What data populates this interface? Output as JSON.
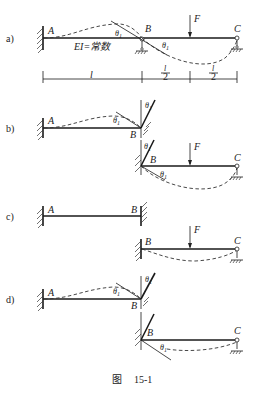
{
  "figure": {
    "caption_prefix": "图",
    "caption_number": "15-1"
  },
  "labels": {
    "A": "A",
    "B": "B",
    "C": "C",
    "F": "F",
    "theta": "θ",
    "theta_sub": "1",
    "stiffness": "EI=常数",
    "len_l": "l",
    "half_num": "l",
    "half_den": "2"
  },
  "panels": [
    {
      "id": "a",
      "label": "a)"
    },
    {
      "id": "b",
      "label": "b)"
    },
    {
      "id": "c",
      "label": "c)"
    },
    {
      "id": "d",
      "label": "d)"
    }
  ],
  "dimensions": [
    "l",
    "l/2",
    "l/2"
  ]
}
